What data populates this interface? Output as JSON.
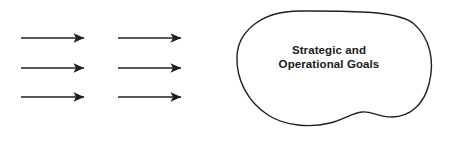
{
  "diagram": {
    "title": "Strategic and Operational Goals",
    "background_color": "#ffffff",
    "stroke_color": "#231f20",
    "text_color": "#1a1a1a",
    "blob": {
      "label_line_1": "Strategic and",
      "label_line_2": "Operational Goals",
      "shape": "freeform-bean",
      "fill": "#ffffff",
      "stroke": "#231f20",
      "stroke_width": 1.4
    },
    "arrow_columns": [
      {
        "name": "left-arrow-column",
        "arrows": [
          {
            "label": "arrow-left-1",
            "x1": 21,
            "y1": 38,
            "x2": 89,
            "y2": 38
          },
          {
            "label": "arrow-left-2",
            "x1": 21,
            "y1": 68,
            "x2": 89,
            "y2": 68
          },
          {
            "label": "arrow-left-3",
            "x1": 21,
            "y1": 97,
            "x2": 89,
            "y2": 97
          }
        ]
      },
      {
        "name": "right-arrow-column",
        "arrows": [
          {
            "label": "arrow-right-1",
            "x1": 118,
            "y1": 38,
            "x2": 186,
            "y2": 38
          },
          {
            "label": "arrow-right-2",
            "x1": 118,
            "y1": 68,
            "x2": 186,
            "y2": 68
          },
          {
            "label": "arrow-right-3",
            "x1": 118,
            "y1": 97,
            "x2": 186,
            "y2": 97
          }
        ]
      }
    ]
  }
}
